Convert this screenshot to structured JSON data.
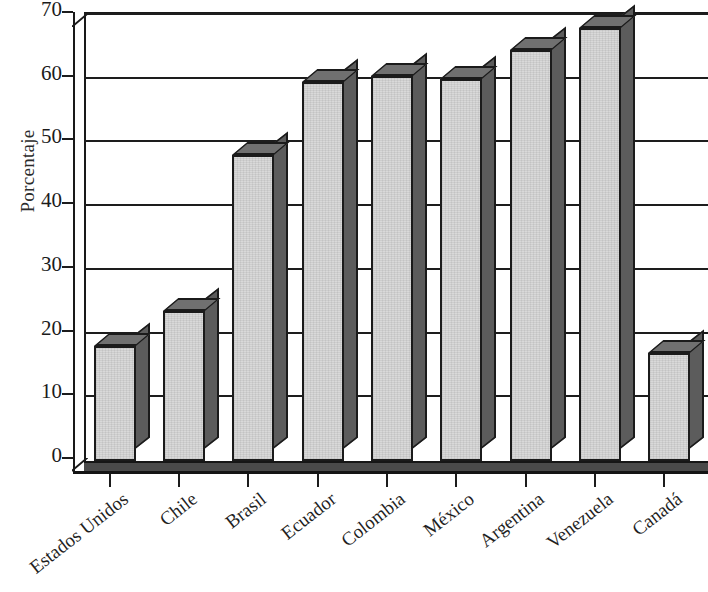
{
  "chart_data": {
    "type": "bar",
    "title": "",
    "subtitle": "",
    "xlabel": "",
    "ylabel": "Porcentaje",
    "ylim": [
      0,
      70
    ],
    "ytick_labels": [
      "70",
      "60",
      "50",
      "40",
      "30",
      "20",
      "10",
      "0"
    ],
    "ytick_values": [
      70,
      60,
      50,
      40,
      30,
      20,
      10,
      0
    ],
    "grid": true,
    "legend": "none",
    "style": "3d-bar",
    "categories": [
      "Estados Unidos",
      "Chile",
      "Brasil",
      "Ecuador",
      "Colombia",
      "México",
      "Argentina",
      "Venezuela",
      "Canadá"
    ],
    "values": [
      18,
      23.5,
      48,
      59.5,
      60.5,
      60,
      64.5,
      68,
      17
    ],
    "colors": {
      "bar_front": "#d9d9d9",
      "bar_side": "#5c5c5c",
      "bar_top": "#707070",
      "outline": "#1b1b1b",
      "gridline": "#1d1d1d",
      "floor": "#4a4a4a",
      "text": "#1f1f1f"
    }
  }
}
